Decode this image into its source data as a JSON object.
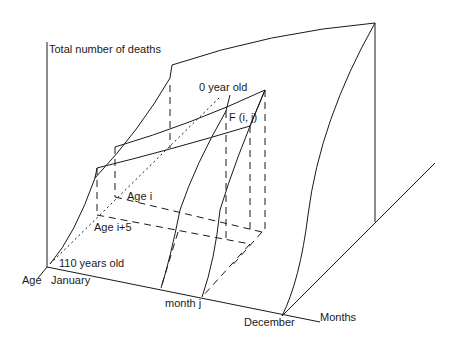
{
  "diagram": {
    "type": "3d-surface-schematic",
    "axes": {
      "vertical": "Total number of deaths",
      "age": "Age",
      "months": "Months"
    },
    "labels": {
      "age_zero": "0 year old",
      "age_max": "110 years old",
      "age_i": "Age i",
      "age_i5": "Age i+5",
      "month_start": "January",
      "month_j": "month j",
      "month_end": "December",
      "point": "F (i, j)"
    },
    "colors": {
      "line": "#1a1a1a",
      "background": "#ffffff"
    }
  }
}
